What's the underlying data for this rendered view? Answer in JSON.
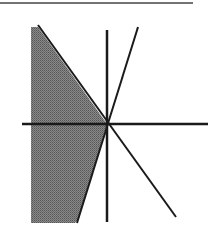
{
  "diagram": {
    "type": "graph-of-linear-inequalities",
    "colors": {
      "background": "#ffffff",
      "lines": "#1a1a1a",
      "shading": "#777777",
      "top_rule": "#444444"
    },
    "axes": {
      "origin_px": [
        107,
        124
      ],
      "x_axis_px": [
        [
          22,
          124
        ],
        [
          208,
          124
        ]
      ],
      "y_axis_px": [
        [
          107,
          30
        ],
        [
          107,
          222
        ]
      ]
    },
    "lines": [
      {
        "name": "negative-slope-line",
        "from_px": [
          38,
          25
        ],
        "to_px": [
          176,
          217
        ]
      },
      {
        "name": "positive-slope-line",
        "from_px": [
          138,
          27
        ],
        "to_px": [
          77,
          223
        ]
      }
    ],
    "shaded_region": {
      "polygon_px": [
        [
          31,
          27
        ],
        [
          38,
          27
        ],
        [
          107,
          124
        ],
        [
          79,
          218
        ],
        [
          75,
          223
        ],
        [
          31,
          223
        ]
      ]
    },
    "top_rule_px": [
      [
        0,
        3
      ],
      [
        193,
        3
      ]
    ]
  }
}
